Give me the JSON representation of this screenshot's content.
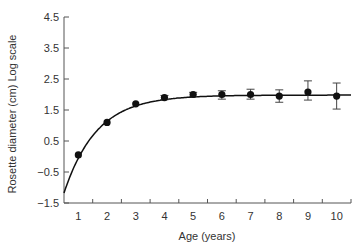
{
  "chart_data": {
    "type": "line",
    "title": "",
    "xlabel": "Age (years)",
    "ylabel": "Rosette diameter (cm) Log scale",
    "xlim": [
      0.5,
      10.5
    ],
    "ylim": [
      -1.5,
      4.5
    ],
    "x_ticks": [
      1,
      2,
      3,
      4,
      5,
      6,
      7,
      8,
      9,
      10
    ],
    "y_ticks": [
      -1.5,
      -0.5,
      0.5,
      1.5,
      2.5,
      3.5,
      4.5
    ],
    "y_tick_labels": [
      "−1.5",
      "−0.5",
      "0.5",
      "1.5",
      "2.5",
      "3.5",
      "4.5"
    ],
    "grid": false,
    "legend": null,
    "series": [
      {
        "name": "Observed",
        "kind": "scatter-with-error-bars",
        "marker": "filled circle",
        "x": [
          1,
          2,
          3,
          4,
          5,
          6,
          7,
          8,
          9,
          10
        ],
        "y": [
          0.05,
          1.1,
          1.7,
          1.9,
          2.0,
          2.0,
          2.0,
          1.95,
          2.08,
          1.95
        ],
        "err_low": [
          0.0,
          0.03,
          0.03,
          0.07,
          0.07,
          0.15,
          0.15,
          0.2,
          0.26,
          0.42
        ],
        "err_high": [
          0.0,
          0.03,
          0.03,
          0.07,
          0.07,
          0.12,
          0.17,
          0.2,
          0.36,
          0.42
        ]
      },
      {
        "name": "Fitted curve",
        "kind": "line",
        "model": "y = A - B*exp(-k*x)",
        "params": {
          "A": 1.98,
          "B": 4.9,
          "k": 0.88
        },
        "x_range": [
          0.5,
          10.5
        ]
      }
    ]
  },
  "colors": {
    "axis": "#555555",
    "series": "#111111",
    "text": "#333333"
  }
}
